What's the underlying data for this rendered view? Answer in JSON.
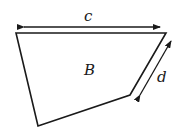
{
  "diagram": {
    "shape_label": "B",
    "top_dimension_label": "c",
    "side_dimension_label": "d",
    "stroke_color": "#1a1a1a",
    "background": "#ffffff"
  }
}
